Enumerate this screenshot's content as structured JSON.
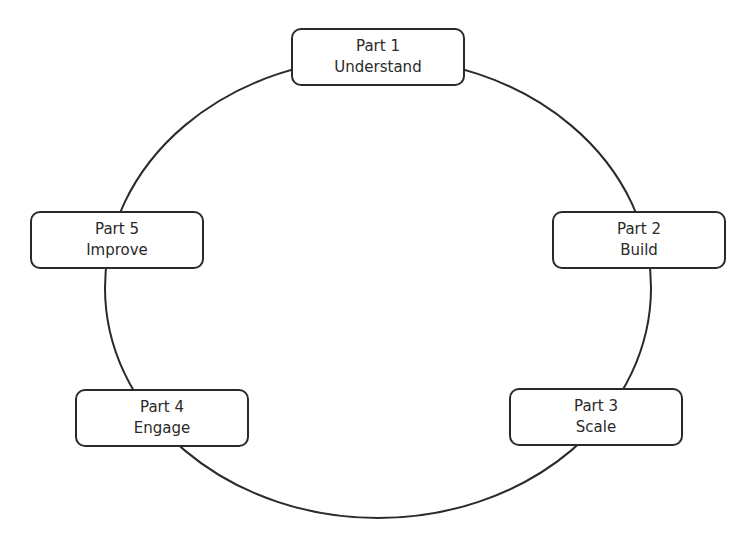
{
  "diagram": {
    "type": "cycle",
    "stroke_color": "#2a2a2a",
    "background": "#ffffff",
    "nodes": [
      {
        "part": "Part 1",
        "label": "Understand"
      },
      {
        "part": "Part 2",
        "label": "Build"
      },
      {
        "part": "Part 3",
        "label": "Scale"
      },
      {
        "part": "Part 4",
        "label": "Engage"
      },
      {
        "part": "Part 5",
        "label": "Improve"
      }
    ]
  }
}
